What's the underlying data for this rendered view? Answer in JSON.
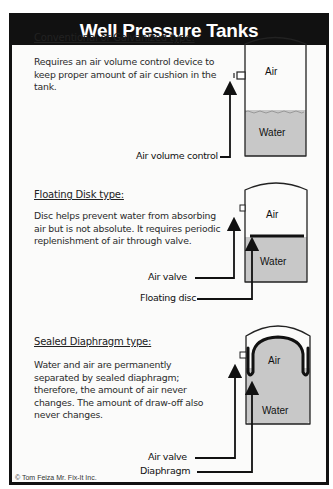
{
  "title": "Well Pressure Tanks",
  "sections": [
    {
      "title": "Conventional or Galvanized type:",
      "description": "Requires an air volume control device to keep proper amount of air cushion in the tank.",
      "tank": {
        "air_label": "Air",
        "water_label": "Water"
      },
      "callouts": [
        "Air volume control"
      ]
    },
    {
      "title": "Floating Disk type:",
      "description": "Disc helps prevent water from absorbing air but is not absolute.  It requires periodic replenishment of air through valve.",
      "tank": {
        "air_label": "Air",
        "water_label": "Water"
      },
      "callouts": [
        "Air valve",
        "Floating disc"
      ]
    },
    {
      "title": "Sealed Diaphragm type:",
      "description": "Water and air are permanently separated by sealed diaphragm; therefore, the amount of air never changes.  The amount of draw-off also never changes.",
      "tank": {
        "air_label": "Air",
        "water_label": "Water"
      },
      "callouts": [
        "Air valve",
        "Diaphragm"
      ]
    }
  ],
  "credit": "© Tom Feiza Mr. Fix-It Inc.",
  "colors": {
    "frame": "#111111",
    "water": "#c8c8c8",
    "background": "#fbfbfa"
  }
}
